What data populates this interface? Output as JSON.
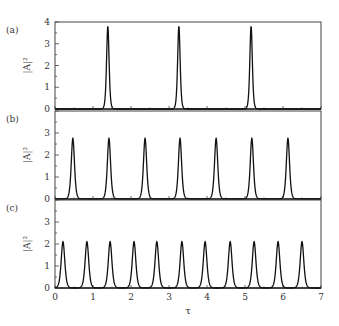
{
  "chart_data": [
    {
      "type": "line",
      "panel_label": "(a)",
      "ylabel": "|A|²",
      "xlabel": "",
      "xlim": [
        0,
        7
      ],
      "ylim": [
        0,
        4
      ],
      "yticks": [
        "0",
        "1",
        "2",
        "3",
        "4"
      ],
      "peak_height": 3.8,
      "peak_width": 0.07,
      "peaks_tau": [
        1.39,
        3.26,
        5.16
      ]
    },
    {
      "type": "line",
      "panel_label": "(b)",
      "ylabel": "|A|²",
      "xlabel": "",
      "xlim": [
        0,
        7
      ],
      "ylim": [
        0,
        4
      ],
      "yticks": [
        "0",
        "1",
        "2",
        "3"
      ],
      "peak_height": 2.75,
      "peak_width": 0.09,
      "peaks_tau": [
        0.47,
        1.42,
        2.37,
        3.29,
        4.24,
        5.18,
        6.13
      ]
    },
    {
      "type": "line",
      "panel_label": "(c)",
      "ylabel": "|A|²",
      "xlabel": "τ",
      "xlim": [
        0,
        7
      ],
      "ylim": [
        0,
        4
      ],
      "yticks": [
        "0",
        "1",
        "2",
        "3"
      ],
      "xticks": [
        "0",
        "1",
        "2",
        "3",
        "4",
        "5",
        "6",
        "7"
      ],
      "peak_height": 2.1,
      "peak_width": 0.1,
      "peaks_tau": [
        0.21,
        0.84,
        1.45,
        2.08,
        2.68,
        3.34,
        3.95,
        4.61,
        5.24,
        5.87,
        6.5
      ]
    }
  ]
}
